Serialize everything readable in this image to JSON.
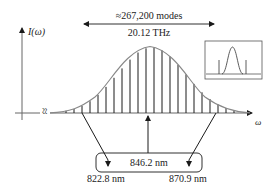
{
  "diagram": {
    "y_axis_label": "I(ω)",
    "x_axis_label": "ω",
    "span_label_top": "≈267,200 modes",
    "span_label_bottom": "20.12 THz",
    "center_wavelength": "846.2 nm",
    "left_wavelength": "822.8 nm",
    "right_wavelength": "870.9 nm",
    "axis_break_symbol": "≈",
    "inset": "frequency comb spectrum with central Gaussian peak and two side lines",
    "colors": {
      "curve": "#888888",
      "lines": "#1a1a1a",
      "text": "#222222",
      "background": "#ffffff"
    }
  }
}
